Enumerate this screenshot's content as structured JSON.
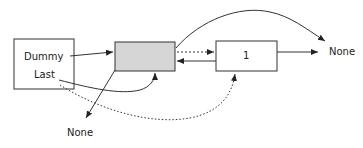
{
  "diagram": {
    "dummy_node": {
      "field1": "Dummy",
      "field2": "Last"
    },
    "sentinel_node": {
      "fill": "#d6d6d6"
    },
    "node1": {
      "value": "1"
    },
    "none_right": "None",
    "none_bottom": "None"
  },
  "colors": {
    "stroke": "#333333",
    "fill_gray": "#d6d6d6",
    "background": "#ffffff"
  }
}
